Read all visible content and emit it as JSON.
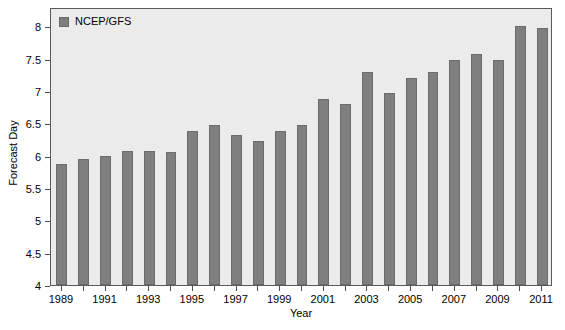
{
  "chart_data": {
    "type": "bar",
    "title": "",
    "xlabel": "Year",
    "ylabel": "Forecast Day",
    "categories": [
      "1989",
      "1990",
      "1991",
      "1992",
      "1993",
      "1994",
      "1995",
      "1996",
      "1997",
      "1998",
      "1999",
      "2000",
      "2001",
      "2002",
      "2003",
      "2004",
      "2005",
      "2006",
      "2007",
      "2008",
      "2009",
      "2010",
      "2011"
    ],
    "values": [
      5.87,
      5.95,
      6.0,
      6.07,
      6.08,
      6.05,
      6.38,
      6.47,
      6.32,
      6.23,
      6.38,
      6.47,
      6.88,
      6.8,
      7.3,
      6.97,
      7.2,
      7.3,
      7.48,
      7.58,
      7.48,
      8.0,
      7.97
    ],
    "series": [
      {
        "name": "NCEP/GFS",
        "values": [
          5.87,
          5.95,
          6.0,
          6.07,
          6.08,
          6.05,
          6.38,
          6.47,
          6.32,
          6.23,
          6.38,
          6.47,
          6.88,
          6.8,
          7.3,
          6.97,
          7.2,
          7.3,
          7.48,
          7.58,
          7.48,
          8.0,
          7.97
        ]
      }
    ],
    "ylim": [
      4,
      8.3
    ],
    "ytick_labels": [
      "4",
      "4.5",
      "5",
      "5.5",
      "6",
      "6.5",
      "7",
      "7.5",
      "8"
    ],
    "ytick_values": [
      4,
      4.5,
      5,
      5.5,
      6,
      6.5,
      7,
      7.5,
      8
    ],
    "xtick_labels": [
      "1989",
      "1991",
      "1993",
      "1995",
      "1997",
      "1999",
      "2001",
      "2003",
      "2005",
      "2007",
      "2009",
      "2011"
    ],
    "grid": false,
    "legend_position": "top-left",
    "bar_color": "#7f7f7f",
    "plot_background": "#ebebeb"
  },
  "legend": {
    "entries": [
      {
        "label": "NCEP/GFS",
        "color": "#7f7f7f",
        "swatch_icon": "square-swatch-icon"
      }
    ]
  },
  "axes": {
    "y_title": "Forecast Day",
    "x_title": "Year"
  }
}
